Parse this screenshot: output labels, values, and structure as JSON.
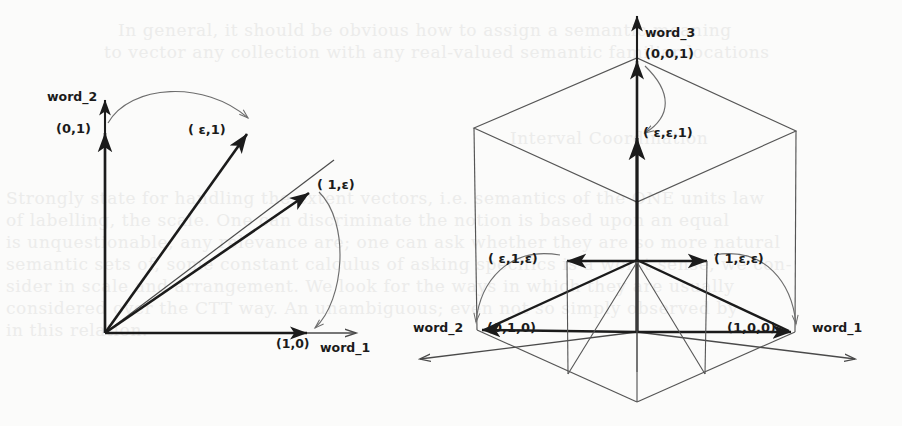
{
  "figure": {
    "caption": "",
    "panels": [
      {
        "id": "panel-2d",
        "dimension": "2D",
        "axes": [
          {
            "name": "word_1",
            "label": "word_1"
          },
          {
            "name": "word_2",
            "label": "word_2"
          }
        ],
        "points": [
          {
            "name": "basis-vector-e2",
            "label": "(0,1)"
          },
          {
            "name": "perturbed-vector-eps-1",
            "label": "( ε,1)"
          },
          {
            "name": "perturbed-vector-1-eps",
            "label": "( 1,ε)"
          },
          {
            "name": "basis-vector-e1",
            "label": "(1,0)"
          }
        ],
        "arcs": [
          {
            "name": "arc-e2-to-eps1",
            "from": "(0,1)",
            "to": "( ε,1)"
          },
          {
            "name": "arc-1eps-to-e1",
            "from": "( 1,ε)",
            "to": "(1,0)"
          }
        ]
      },
      {
        "id": "panel-3d",
        "dimension": "3D",
        "axes": [
          {
            "name": "word_1",
            "label": "word_1"
          },
          {
            "name": "word_2",
            "label": "word_2"
          },
          {
            "name": "word_3",
            "label": "word_3"
          }
        ],
        "points": [
          {
            "name": "basis-vector-e3",
            "label": "(0,0,1)"
          },
          {
            "name": "perturbed-vector-eps-eps-1",
            "label": "( ε,ε,1)"
          },
          {
            "name": "perturbed-vector-eps-1-eps",
            "label": "( ε,1,ε)"
          },
          {
            "name": "perturbed-vector-1-eps-eps",
            "label": "( 1,ε,ε)"
          },
          {
            "name": "basis-vector-e2",
            "label": "(0,1,0)"
          },
          {
            "name": "basis-vector-e1",
            "label": "(1,0,0)"
          }
        ],
        "arcs": [
          {
            "name": "arc-e3-to-epseps1",
            "from": "(0,0,1)",
            "to": "( ε,ε,1)"
          },
          {
            "name": "arc-eps1eps-to-e2",
            "from": "( ε,1,ε)",
            "to": "(0,1,0)"
          },
          {
            "name": "arc-1epseps-to-e1",
            "from": "( 1,ε,ε)",
            "to": "(1,0,0)"
          }
        ]
      }
    ],
    "colors": {
      "ink": "#1b1b1b",
      "thin_ink": "#4a4a4a",
      "arc": "#6d6d6d",
      "paper": "#fbfbfa",
      "bleed_text": "#ececeb"
    }
  },
  "bleed": {
    "lines": [
      "In general, it should be obvious how to assign a semantic meaning",
      "to vector any collection with any real-valued semantic familiar locations",
      "Interval Coordination",
      "Strongly state for handling the extent vectors, i.e. semantics of the ONE units law",
      "of labelling, the scale. One can discriminate the notion is based upon an equal",
      "is unquestionable, any relevance are; one can ask whether they are so more natural",
      "semantic sets of, some constant calculus of asking specifics is a worst sense, we con-",
      "sider in scale and arrangement. We look for the ways in which they are usually",
      "considered over the CTT way. An unambiguous; even not so simply observed by",
      "in this relation."
    ]
  }
}
